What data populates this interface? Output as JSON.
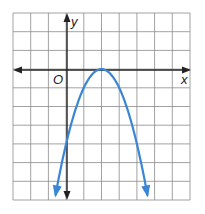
{
  "chart_data": {
    "type": "line",
    "title": "",
    "xlabel": "x",
    "ylabel": "y",
    "origin_label": "O",
    "function": "y = -(x - 2)^2",
    "vertex": [
      2,
      0
    ],
    "y_intercept": [
      0,
      -4
    ],
    "x": [
      -0.6,
      0,
      1,
      2,
      3,
      4,
      4.6
    ],
    "values": [
      -6.76,
      -4,
      -1,
      0,
      -1,
      -4,
      -6.76
    ],
    "xlim": [
      -3,
      7
    ],
    "ylim": [
      -7,
      3
    ],
    "grid": true,
    "curve_color": "#3a86d4",
    "axis_color": "#222222",
    "grid_color": "#8a8a8a"
  }
}
